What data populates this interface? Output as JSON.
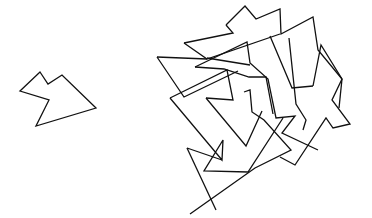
{
  "figure": {
    "width": 372,
    "height": 218,
    "background": "#ffffff",
    "stroke_color": "#111111",
    "target_shape": {
      "label": "",
      "points": [
        [
          40,
          72
        ],
        [
          48,
          84
        ],
        [
          62,
          75
        ],
        [
          96,
          108
        ],
        [
          36,
          126
        ],
        [
          49,
          100
        ],
        [
          20,
          91
        ]
      ]
    },
    "pieces": [
      {
        "points": [
          [
            226,
            25
          ],
          [
            245,
            6
          ],
          [
            256,
            19
          ],
          [
            280,
            9
          ],
          [
            281,
            34
          ],
          [
            313,
            17
          ],
          [
            318,
            50
          ],
          [
            342,
            79
          ]
        ]
      },
      {
        "points": [
          [
            157,
            57
          ],
          [
            184,
            97
          ],
          [
            238,
            71
          ]
        ]
      },
      {
        "points": [
          [
            184,
            43
          ],
          [
            233,
            33
          ],
          [
            226,
            25
          ]
        ]
      },
      {
        "points": [
          [
            184,
            43
          ],
          [
            207,
            59
          ],
          [
            280,
            34
          ]
        ]
      },
      {
        "points": [
          [
            157,
            57
          ],
          [
            207,
            59
          ]
        ]
      },
      {
        "points": [
          [
            195,
            67
          ],
          [
            247,
            42
          ],
          [
            250,
            63
          ],
          [
            268,
            79
          ],
          [
            276,
            118
          ],
          [
            295,
            116
          ],
          [
            282,
            133
          ],
          [
            318,
            150
          ]
        ]
      },
      {
        "points": [
          [
            195,
            67
          ],
          [
            224,
            69
          ],
          [
            249,
            77
          ],
          [
            266,
            77
          ],
          [
            273,
            114
          ]
        ]
      },
      {
        "points": [
          [
            270,
            36
          ],
          [
            292,
            88
          ],
          [
            313,
            86
          ]
        ]
      },
      {
        "points": [
          [
            170,
            98
          ],
          [
            227,
            70
          ],
          [
            233,
            100
          ],
          [
            206,
            98
          ]
        ]
      },
      {
        "points": [
          [
            207,
            58
          ],
          [
            250,
            65
          ]
        ]
      },
      {
        "points": [
          [
            206,
            98
          ],
          [
            246,
            146
          ],
          [
            262,
            111
          ]
        ]
      },
      {
        "points": [
          [
            244,
            92
          ],
          [
            250,
            90
          ],
          [
            252,
            112
          ],
          [
            264,
            120
          ],
          [
            291,
            150
          ],
          [
            255,
            168
          ],
          [
            190,
            214
          ]
        ]
      },
      {
        "points": [
          [
            170,
            98
          ],
          [
            222,
            160
          ],
          [
            223,
            140
          ],
          [
            204,
            171
          ],
          [
            248,
            172
          ],
          [
            283,
            118
          ]
        ]
      },
      {
        "points": [
          [
            187,
            148
          ],
          [
            222,
            160
          ]
        ]
      },
      {
        "points": [
          [
            187,
            148
          ],
          [
            216,
            210
          ]
        ]
      },
      {
        "points": [
          [
            313,
            86
          ],
          [
            321,
            45
          ],
          [
            342,
            79
          ],
          [
            332,
            100
          ],
          [
            350,
            124
          ],
          [
            333,
            128
          ],
          [
            326,
            118
          ],
          [
            295,
            165
          ],
          [
            280,
            157
          ]
        ]
      },
      {
        "points": [
          [
            339,
            108
          ],
          [
            342,
            79
          ]
        ]
      },
      {
        "points": [
          [
            289,
            38
          ],
          [
            296,
            104
          ],
          [
            306,
            120
          ],
          [
            303,
            130
          ]
        ]
      }
    ]
  }
}
